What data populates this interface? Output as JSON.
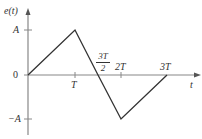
{
  "diagram": {
    "y_axis_label": "e(t)",
    "x_axis_label": "t",
    "y_ticks": [
      {
        "label": "A",
        "value": "A"
      },
      {
        "label": "0",
        "value": "0"
      },
      {
        "label": "−A",
        "value": "-A"
      }
    ],
    "x_ticks": [
      {
        "label": "T"
      },
      {
        "label_num": "3T",
        "label_den": "2"
      },
      {
        "label": "2T"
      },
      {
        "label": "3T"
      }
    ],
    "waveform_points": [
      {
        "t": "0",
        "e": "0"
      },
      {
        "t": "T",
        "e": "A"
      },
      {
        "t": "3T/2",
        "e": "0"
      },
      {
        "t": "2T",
        "e": "-A"
      },
      {
        "t": "3T",
        "e": "0"
      }
    ],
    "colors": {
      "axis": "#777777",
      "curve": "#333333",
      "text": "#333333"
    }
  }
}
